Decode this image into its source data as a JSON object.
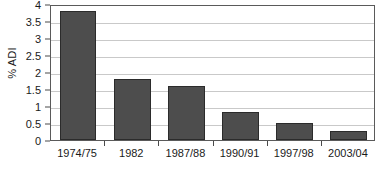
{
  "chart_data": {
    "type": "bar",
    "title": "",
    "xlabel": "",
    "ylabel": "% ADI",
    "categories": [
      "1974/75",
      "1982",
      "1987/88",
      "1990/91",
      "1997/98",
      "2003/04"
    ],
    "values": [
      3.8,
      1.8,
      1.58,
      0.82,
      0.5,
      0.26
    ],
    "ylim": [
      0,
      4
    ],
    "ytick_labels": [
      "0",
      "0.5",
      "1",
      "1.5",
      "2",
      "2.5",
      "3",
      "3.5",
      "4"
    ],
    "ytick_values": [
      0,
      0.5,
      1,
      1.5,
      2,
      2.5,
      3,
      3.5,
      4
    ],
    "grid": true,
    "legend": "none",
    "series": [
      {
        "name": "% ADI",
        "values": [
          3.8,
          1.8,
          1.58,
          0.82,
          0.5,
          0.26
        ]
      }
    ],
    "colors": {
      "bar_fill": "#4d4d4d",
      "bar_border": "#2b2b2b",
      "gridline": "#c9c9c9",
      "frame": "#5a5a5a",
      "background": "#ffffff",
      "text": "#1a1a1a"
    }
  }
}
